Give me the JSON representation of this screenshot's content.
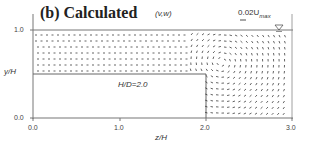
{
  "figure": {
    "title": "(b) Calculated",
    "vector_label": "(v,w)",
    "scale_label": "0.02U",
    "scale_sub": "max",
    "annotation": "H/D=2.0",
    "free_surface_symbol": "▽"
  },
  "axes": {
    "xlabel": "z/H",
    "ylabel": "y/H",
    "xticks": [
      "0.0",
      "1.0",
      "2.0",
      "3.0"
    ],
    "yticks": [
      "1.0",
      "0.0"
    ],
    "xlim": [
      0.0,
      3.0
    ],
    "ylim": [
      0.0,
      1.0
    ]
  },
  "geometry": {
    "step_height": 0.5,
    "step_end_z": 2.0
  },
  "colors": {
    "axis": "#666666",
    "vector": "#222222"
  }
}
